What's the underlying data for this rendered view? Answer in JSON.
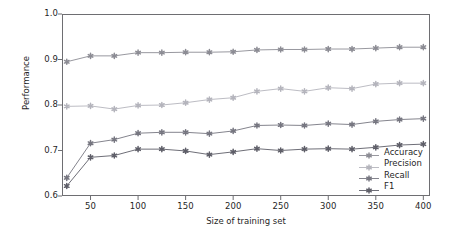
{
  "chart_data": {
    "type": "line",
    "title": "",
    "xlabel": "Size of training set",
    "ylabel": "Performance",
    "xlim": [
      20,
      407
    ],
    "ylim": [
      0.6,
      1.0
    ],
    "xticks": [
      50,
      100,
      150,
      200,
      250,
      300,
      350,
      400
    ],
    "xticklabels": [
      "50",
      "100",
      "150",
      "200",
      "250",
      "300",
      "350",
      "400"
    ],
    "yticks": [
      0.6,
      0.7,
      0.8,
      0.9,
      1.0
    ],
    "yticklabels": [
      "0.6",
      "0.7",
      "0.8",
      "0.9",
      "1.0"
    ],
    "grid": false,
    "legend_position": "center right (inside axes)",
    "marker": "star",
    "x": [
      25,
      50,
      75,
      100,
      125,
      150,
      175,
      200,
      225,
      250,
      275,
      300,
      325,
      350,
      375,
      400
    ],
    "series": [
      {
        "name": "Accuracy",
        "color": "#8c8c94",
        "values": [
          0.895,
          0.908,
          0.908,
          0.915,
          0.915,
          0.916,
          0.916,
          0.917,
          0.921,
          0.922,
          0.922,
          0.923,
          0.923,
          0.925,
          0.927,
          0.927
        ]
      },
      {
        "name": "Precision",
        "color": "#b4b4bc",
        "values": [
          0.797,
          0.798,
          0.791,
          0.799,
          0.8,
          0.805,
          0.812,
          0.816,
          0.83,
          0.836,
          0.83,
          0.838,
          0.836,
          0.846,
          0.848,
          0.848
        ]
      },
      {
        "name": "Recall",
        "color": "#767680",
        "values": [
          0.64,
          0.716,
          0.724,
          0.738,
          0.74,
          0.74,
          0.737,
          0.743,
          0.755,
          0.756,
          0.755,
          0.759,
          0.757,
          0.764,
          0.768,
          0.77
        ]
      },
      {
        "name": "F1",
        "color": "#5e5e68",
        "values": [
          0.622,
          0.685,
          0.689,
          0.703,
          0.703,
          0.699,
          0.691,
          0.697,
          0.704,
          0.7,
          0.703,
          0.704,
          0.703,
          0.707,
          0.712,
          0.714
        ]
      }
    ]
  },
  "legend": {
    "items": [
      {
        "label": "Accuracy"
      },
      {
        "label": "Precision"
      },
      {
        "label": "Recall"
      },
      {
        "label": "F1"
      }
    ]
  }
}
